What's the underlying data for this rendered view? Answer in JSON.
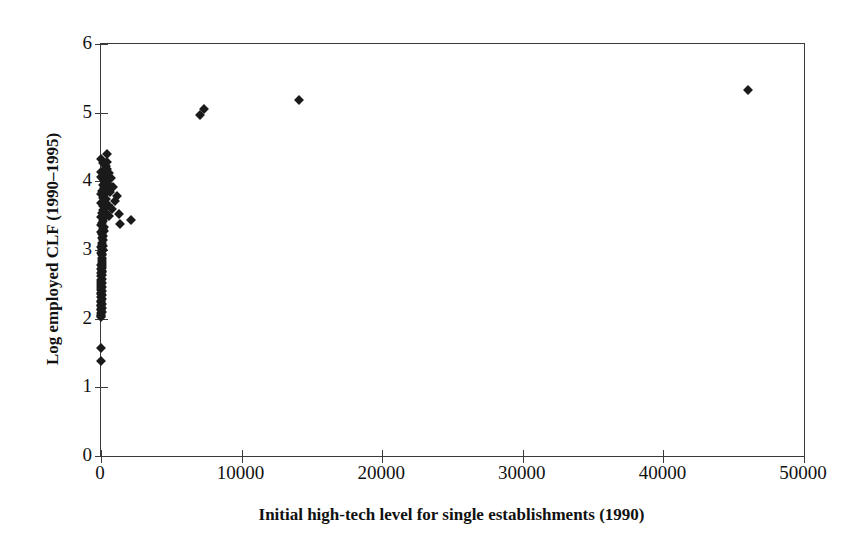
{
  "chart_data": {
    "type": "scatter",
    "title": "",
    "xlabel": "Initial high-tech level for single establishments (1990)",
    "ylabel": "Log employed CLF (1990–1995)",
    "xlim": [
      0,
      50000
    ],
    "ylim": [
      0,
      6
    ],
    "xticks": [
      0,
      10000,
      20000,
      30000,
      40000,
      50000
    ],
    "yticks": [
      0,
      1,
      2,
      3,
      4,
      5,
      6
    ],
    "xtick_labels": [
      "0",
      "10000",
      "20000",
      "30000",
      "40000",
      "50000"
    ],
    "ytick_labels": [
      "0",
      "1",
      "2",
      "3",
      "4",
      "5",
      "6"
    ],
    "grid": false,
    "legend": false,
    "marker": "diamond",
    "marker_color": "#1a1a1a",
    "marker_size": 7,
    "axis_color": "#3a3a3a",
    "background": "#ffffff",
    "series": [
      {
        "name": "establishments",
        "points": [
          [
            46000,
            5.33
          ],
          [
            14050,
            5.19
          ],
          [
            7320,
            5.05
          ],
          [
            7010,
            4.96
          ],
          [
            2150,
            3.44
          ],
          [
            1380,
            3.38
          ],
          [
            1300,
            3.52
          ],
          [
            1120,
            3.78
          ],
          [
            980,
            3.72
          ],
          [
            820,
            3.92
          ],
          [
            760,
            3.6
          ],
          [
            700,
            4.05
          ],
          [
            640,
            3.84
          ],
          [
            600,
            3.5
          ],
          [
            560,
            4.12
          ],
          [
            520,
            3.66
          ],
          [
            480,
            3.96
          ],
          [
            450,
            4.28
          ],
          [
            430,
            4.4
          ],
          [
            410,
            4.18
          ],
          [
            390,
            4.02
          ],
          [
            370,
            3.88
          ],
          [
            350,
            3.74
          ],
          [
            330,
            4.22
          ],
          [
            310,
            3.62
          ],
          [
            300,
            4.08
          ],
          [
            285,
            3.98
          ],
          [
            270,
            3.56
          ],
          [
            258,
            4.0
          ],
          [
            246,
            3.46
          ],
          [
            235,
            4.1
          ],
          [
            224,
            3.9
          ],
          [
            214,
            3.34
          ],
          [
            205,
            3.7
          ],
          [
            196,
            4.16
          ],
          [
            188,
            3.28
          ],
          [
            180,
            3.8
          ],
          [
            172,
            4.04
          ],
          [
            165,
            3.2
          ],
          [
            158,
            3.58
          ],
          [
            151,
            3.94
          ],
          [
            145,
            3.14
          ],
          [
            139,
            3.42
          ],
          [
            133,
            4.26
          ],
          [
            128,
            3.06
          ],
          [
            123,
            3.76
          ],
          [
            118,
            3.3
          ],
          [
            113,
            3.0
          ],
          [
            109,
            3.64
          ],
          [
            104,
            2.94
          ],
          [
            100,
            3.86
          ],
          [
            96,
            2.88
          ],
          [
            92,
            3.24
          ],
          [
            89,
            2.82
          ],
          [
            85,
            3.54
          ],
          [
            82,
            2.76
          ],
          [
            79,
            3.1
          ],
          [
            76,
            2.7
          ],
          [
            73,
            3.4
          ],
          [
            70,
            2.64
          ],
          [
            67,
            3.02
          ],
          [
            65,
            2.58
          ],
          [
            62,
            3.18
          ],
          [
            60,
            2.52
          ],
          [
            58,
            2.92
          ],
          [
            56,
            2.46
          ],
          [
            54,
            3.08
          ],
          [
            52,
            2.4
          ],
          [
            50,
            2.86
          ],
          [
            48,
            2.34
          ],
          [
            46,
            2.98
          ],
          [
            45,
            2.28
          ],
          [
            43,
            2.8
          ],
          [
            42,
            2.22
          ],
          [
            40,
            2.74
          ],
          [
            39,
            2.16
          ],
          [
            38,
            2.68
          ],
          [
            36,
            2.1
          ],
          [
            35,
            2.62
          ],
          [
            34,
            2.04
          ],
          [
            33,
            2.56
          ],
          [
            32,
            2.5
          ],
          [
            31,
            2.44
          ],
          [
            30,
            2.38
          ],
          [
            29,
            2.32
          ],
          [
            28,
            2.26
          ],
          [
            27,
            2.2
          ],
          [
            26,
            2.14
          ],
          [
            25,
            2.08
          ],
          [
            24,
            2.02
          ],
          [
            23,
            2.36
          ],
          [
            22,
            2.54
          ],
          [
            21,
            2.78
          ],
          [
            20,
            3.04
          ],
          [
            19,
            3.26
          ],
          [
            18,
            3.48
          ],
          [
            17,
            3.68
          ],
          [
            16,
            3.82
          ],
          [
            15,
            4.06
          ],
          [
            14,
            4.14
          ],
          [
            13,
            4.32
          ],
          [
            12,
            3.36
          ],
          [
            11,
            2.96
          ],
          [
            10,
            2.66
          ],
          [
            9,
            2.42
          ],
          [
            8,
            2.24
          ],
          [
            7,
            2.12
          ],
          [
            6,
            2.06
          ],
          [
            5,
            1.57
          ],
          [
            4,
            1.38
          ],
          [
            3,
            2.18
          ],
          [
            2,
            2.48
          ],
          [
            1,
            2.72
          ]
        ]
      }
    ]
  },
  "axes": {
    "y_title": "Log employed CLF (1990–1995)",
    "x_title": "Initial high-tech level for single establishments (1990)"
  }
}
